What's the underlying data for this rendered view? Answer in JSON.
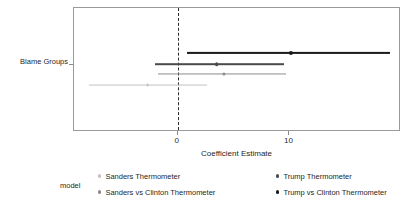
{
  "chart_data": {
    "type": "scatter",
    "title": "",
    "xlabel": "Coefficient Estimate",
    "ylabel": "",
    "xlim": [
      -9.3,
      20.0
    ],
    "xticks": [
      0,
      10
    ],
    "xtick_labels": [
      "0",
      "10"
    ],
    "categories": [
      "Blame Groups"
    ],
    "grid": false,
    "legend_position": "bottom",
    "legend_title": "model",
    "reference_line": 0,
    "reference_line_style": "dashed",
    "series": [
      {
        "name": "Trump vs Clinton Thermometer",
        "estimate": 10.1,
        "conf_low": 0.8,
        "conf_high": 19.0,
        "color": "#1a1a1a",
        "row": 0
      },
      {
        "name": "Trump Thermometer",
        "estimate": 3.5,
        "conf_low": -2.0,
        "conf_high": 9.5,
        "color": "#4a4a4a",
        "row": 1
      },
      {
        "name": "Sanders vs Clinton Thermometer",
        "estimate": 4.1,
        "conf_low": -1.8,
        "conf_high": 9.7,
        "color": "#8c8c8c",
        "row": 2
      },
      {
        "name": "Sanders Thermometer",
        "estimate": -2.7,
        "conf_low": -8.0,
        "conf_high": 2.6,
        "color": "#c2c2c2",
        "row": 3
      }
    ]
  },
  "axes": {
    "y_axis_title": "Blame Groups",
    "x_axis_title": "Coefficient Estimate",
    "xtick_0": "0",
    "xtick_10": "10"
  },
  "legend": {
    "title": "model",
    "entries": [
      {
        "label": "Sanders Thermometer",
        "color": "#c2c2c2"
      },
      {
        "label": "Trump Thermometer",
        "color": "#4a4a4a"
      },
      {
        "label": "Sanders vs Clinton Thermometer",
        "color": "#8c8c8c"
      },
      {
        "label": "Trump vs Clinton Thermometer",
        "color": "#1a1a1a"
      }
    ]
  }
}
